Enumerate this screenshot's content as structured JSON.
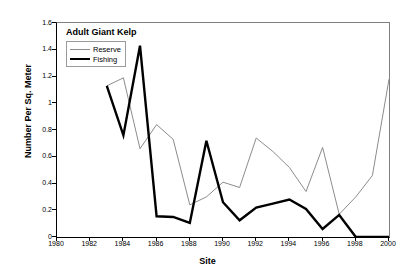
{
  "chart_data": {
    "type": "line",
    "title": "Adult Giant Kelp",
    "xlabel": "Site",
    "ylabel": "Number Per Sq. Meter",
    "x": [
      1983,
      1984,
      1985,
      1986,
      1987,
      1988,
      1989,
      1990,
      1991,
      1992,
      1993,
      1994,
      1995,
      1996,
      1997,
      1998,
      1999,
      2000
    ],
    "xlim": [
      1980,
      2000
    ],
    "ylim": [
      0,
      1.6
    ],
    "grid": false,
    "legend_position": "top-left",
    "xticks": [
      1980,
      1982,
      1984,
      1986,
      1988,
      1990,
      1992,
      1994,
      1996,
      1998,
      2000
    ],
    "xtick_labels": [
      "1980",
      "1982",
      "1984",
      "1986",
      "1988",
      "1990",
      "1992",
      "1994",
      "1996",
      "1998",
      "2000"
    ],
    "yticks": [
      0,
      0.2,
      0.4,
      0.6,
      0.8,
      1,
      1.2,
      1.4,
      1.6
    ],
    "ytick_labels": [
      "0",
      "0.2",
      "0.4",
      "0.6",
      "0.8",
      "1",
      "1.2",
      "1.4",
      "1.6"
    ],
    "series": [
      {
        "name": "Reserve",
        "color": "#8c8c8c",
        "line_width": 1,
        "values": [
          1.13,
          1.19,
          0.66,
          0.84,
          0.73,
          0.24,
          0.3,
          0.41,
          0.37,
          0.74,
          0.64,
          0.52,
          0.34,
          0.67,
          0.17,
          0.3,
          0.46,
          1.18
        ]
      },
      {
        "name": "Fishing",
        "color": "#000000",
        "line_width": 2.4,
        "values": [
          1.13,
          0.76,
          1.43,
          0.155,
          0.15,
          0.105,
          0.72,
          0.26,
          0.125,
          0.22,
          0.25,
          0.28,
          0.21,
          0.06,
          0.165,
          0.0,
          0.0,
          0.0
        ]
      }
    ]
  }
}
